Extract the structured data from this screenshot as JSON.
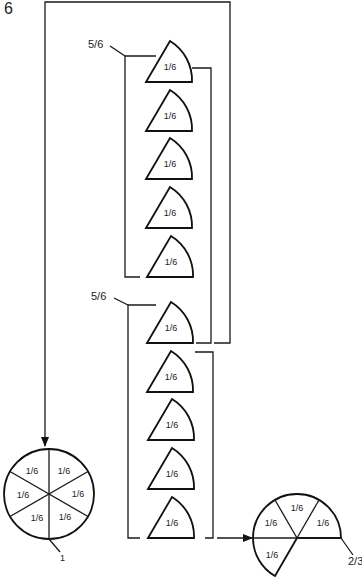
{
  "figure": {
    "number": "6"
  },
  "groups": [
    {
      "label": "5/6",
      "pieces": [
        "1/6",
        "1/6",
        "1/6",
        "1/6",
        "1/6"
      ]
    },
    {
      "label": "5/6",
      "pieces": [
        "1/6",
        "1/6",
        "1/6",
        "1/6",
        "1/6"
      ]
    }
  ],
  "whole_circle": {
    "label": "1",
    "slices": [
      "1/6",
      "1/6",
      "1/6",
      "1/6",
      "1/6",
      "1/6"
    ]
  },
  "result_circle": {
    "label": "2/3",
    "slices": [
      "1/6",
      "1/6",
      "1/6",
      "1/6"
    ]
  },
  "colors": {
    "stroke": "#111111",
    "background": "#ffffff"
  }
}
